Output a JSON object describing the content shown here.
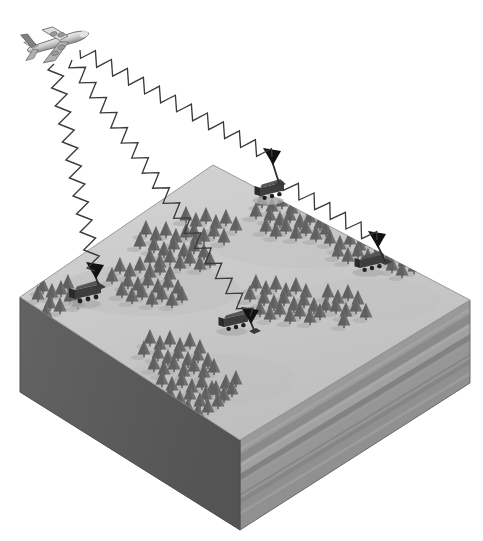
{
  "figure": {
    "domain": "Diagram",
    "kind": "isometric-block-diagram",
    "background_color": "#ffffff",
    "width": 483,
    "height": 541
  },
  "colors": {
    "background": "#ffffff",
    "terrain_top": "#c7c7c7",
    "terrain_top_highlight": "#d2d2d2",
    "terrain_shadow": "#b3b3b3",
    "block_left_face": "#5a5a5a",
    "block_right_face_base": "#8e8e8e",
    "strata_light": "#a6a6a6",
    "strata_mid": "#919191",
    "strata_dark": "#7d7d7d",
    "tree_body": "#6e6e6e",
    "tree_dark": "#555555",
    "vehicle_body": "#3d3d3d",
    "vehicle_dark": "#2a2a2a",
    "aircraft_light": "#dcdcdc",
    "aircraft_mid": "#b0b0b0",
    "aircraft_dark": "#808080",
    "signal_wave": "#3b3b3b",
    "receiver_arrow": "#111111",
    "outline": "#4a4a4a"
  },
  "aircraft": {
    "name": "transmitter-aircraft",
    "label": "airborne transmitter",
    "type": "four-engine jet airliner",
    "position": {
      "x": 58,
      "y": 42
    },
    "heading": "upper-right",
    "role": "signal source"
  },
  "terrain_block": {
    "name": "terrain-block",
    "label": "isometric terrain block",
    "top_face": {
      "name": "terrain-top-surface",
      "label": "forested ground surface",
      "corners": [
        {
          "x": 213,
          "y": 165
        },
        {
          "x": 470,
          "y": 300
        },
        {
          "x": 240,
          "y": 440
        },
        {
          "x": 20,
          "y": 297
        }
      ]
    },
    "left_face": {
      "name": "block-left-face",
      "label": "left cut face",
      "corners": [
        {
          "x": 20,
          "y": 297
        },
        {
          "x": 240,
          "y": 440
        },
        {
          "x": 240,
          "y": 530
        },
        {
          "x": 20,
          "y": 392
        }
      ],
      "fill": "#5a5a5a"
    },
    "right_face": {
      "name": "block-right-face",
      "label": "right cut face with geological strata",
      "corners": [
        {
          "x": 240,
          "y": 440
        },
        {
          "x": 470,
          "y": 300
        },
        {
          "x": 470,
          "y": 383
        },
        {
          "x": 240,
          "y": 530
        }
      ],
      "strata_count": 7
    }
  },
  "strata": [
    {
      "name": "stratum-1",
      "label": "upper layer",
      "offset": 0,
      "thickness": 14,
      "fill": "#9b9b9b"
    },
    {
      "name": "stratum-2",
      "label": "layer 2",
      "offset": 14,
      "thickness": 9,
      "fill": "#8a8a8a"
    },
    {
      "name": "stratum-3",
      "label": "layer 3",
      "offset": 23,
      "thickness": 11,
      "fill": "#a2a2a2"
    },
    {
      "name": "stratum-4",
      "label": "layer 4",
      "offset": 34,
      "thickness": 8,
      "fill": "#828282"
    },
    {
      "name": "stratum-5",
      "label": "layer 5",
      "offset": 42,
      "thickness": 12,
      "fill": "#979797"
    },
    {
      "name": "stratum-6",
      "label": "layer 6",
      "offset": 54,
      "thickness": 10,
      "fill": "#868686"
    },
    {
      "name": "stratum-7",
      "label": "lower layer",
      "offset": 64,
      "thickness": 26,
      "fill": "#909090"
    }
  ],
  "signals": [
    {
      "name": "signal-beam-1",
      "label": "signal to station 1 (far station, north-east)",
      "from": {
        "x": 80,
        "y": 50
      },
      "to": {
        "x": 272,
        "y": 157
      },
      "amplitude": 7,
      "wavelength": 9,
      "arrow": true
    },
    {
      "name": "signal-beam-2",
      "label": "signal to station 2 (west station)",
      "from": {
        "x": 54,
        "y": 64
      },
      "to": {
        "x": 95,
        "y": 271
      },
      "amplitude": 7,
      "wavelength": 9,
      "arrow": true
    },
    {
      "name": "signal-beam-3",
      "label": "signal to station 3 (centre station)",
      "from": {
        "x": 72,
        "y": 60
      },
      "to": {
        "x": 250,
        "y": 316
      },
      "amplitude": 7,
      "wavelength": 9,
      "arrow": true
    },
    {
      "name": "signal-beam-4",
      "label": "relay signal to station 4 (east station)",
      "from": {
        "x": 283,
        "y": 182
      },
      "to": {
        "x": 377,
        "y": 240
      },
      "amplitude": 7,
      "wavelength": 9,
      "arrow": true
    }
  ],
  "ground_stations": [
    {
      "name": "ground-station-west",
      "label": "mobile receiver station, west",
      "vehicle": {
        "x": 88,
        "y": 299,
        "scale": 1.0
      },
      "antenna": {
        "x": 99,
        "y": 283,
        "height": 18
      },
      "arrowhead": {
        "x": 95,
        "y": 271
      }
    },
    {
      "name": "ground-station-north",
      "label": "mobile receiver station, north",
      "vehicle": {
        "x": 272,
        "y": 196,
        "scale": 0.92
      },
      "antenna": {
        "x": 279,
        "y": 180,
        "height": 16
      },
      "arrowhead": {
        "x": 272,
        "y": 157
      }
    },
    {
      "name": "ground-station-centre",
      "label": "mobile receiver station, centre",
      "vehicle": {
        "x": 236,
        "y": 327,
        "scale": 0.92
      },
      "antenna": {
        "x": 254,
        "y": 327,
        "height": 16
      },
      "arrowhead": {
        "x": 250,
        "y": 316
      }
    },
    {
      "name": "ground-station-east",
      "label": "mobile receiver station, east",
      "vehicle": {
        "x": 372,
        "y": 268,
        "scale": 0.92
      },
      "antenna": {
        "x": 385,
        "y": 258,
        "height": 16
      },
      "arrowhead": {
        "x": 377,
        "y": 240
      }
    }
  ],
  "forest": {
    "name": "forest",
    "label": "coniferous tree cover",
    "tree_count": 168,
    "description": "scattered clusters of conical pine trees with cast shadows"
  },
  "tree_positions": [
    [
      43,
      293
    ],
    [
      52,
      299
    ],
    [
      61,
      296
    ],
    [
      70,
      303
    ],
    [
      50,
      310
    ],
    [
      60,
      313
    ],
    [
      38,
      301
    ],
    [
      68,
      290
    ],
    [
      78,
      308
    ],
    [
      46,
      319
    ],
    [
      120,
      273
    ],
    [
      130,
      278
    ],
    [
      140,
      272
    ],
    [
      150,
      279
    ],
    [
      160,
      274
    ],
    [
      170,
      281
    ],
    [
      128,
      288
    ],
    [
      138,
      292
    ],
    [
      148,
      287
    ],
    [
      158,
      294
    ],
    [
      168,
      289
    ],
    [
      178,
      295
    ],
    [
      112,
      283
    ],
    [
      122,
      297
    ],
    [
      132,
      303
    ],
    [
      142,
      299
    ],
    [
      152,
      306
    ],
    [
      162,
      301
    ],
    [
      172,
      307
    ],
    [
      182,
      302
    ],
    [
      146,
      236
    ],
    [
      156,
      242
    ],
    [
      166,
      237
    ],
    [
      176,
      244
    ],
    [
      186,
      239
    ],
    [
      196,
      246
    ],
    [
      154,
      252
    ],
    [
      164,
      257
    ],
    [
      174,
      251
    ],
    [
      184,
      258
    ],
    [
      194,
      253
    ],
    [
      204,
      259
    ],
    [
      140,
      248
    ],
    [
      150,
      264
    ],
    [
      160,
      269
    ],
    [
      170,
      264
    ],
    [
      180,
      270
    ],
    [
      190,
      265
    ],
    [
      200,
      271
    ],
    [
      210,
      267
    ],
    [
      186,
      222
    ],
    [
      196,
      228
    ],
    [
      206,
      223
    ],
    [
      216,
      230
    ],
    [
      226,
      225
    ],
    [
      236,
      232
    ],
    [
      194,
      238
    ],
    [
      204,
      243
    ],
    [
      214,
      238
    ],
    [
      224,
      244
    ],
    [
      262,
      207
    ],
    [
      272,
      213
    ],
    [
      282,
      208
    ],
    [
      292,
      215
    ],
    [
      302,
      210
    ],
    [
      312,
      216
    ],
    [
      270,
      222
    ],
    [
      280,
      227
    ],
    [
      290,
      222
    ],
    [
      300,
      229
    ],
    [
      310,
      224
    ],
    [
      320,
      230
    ],
    [
      256,
      218
    ],
    [
      266,
      233
    ],
    [
      276,
      238
    ],
    [
      286,
      233
    ],
    [
      296,
      240
    ],
    [
      306,
      235
    ],
    [
      316,
      241
    ],
    [
      326,
      236
    ],
    [
      330,
      245
    ],
    [
      340,
      251
    ],
    [
      350,
      246
    ],
    [
      360,
      252
    ],
    [
      370,
      247
    ],
    [
      380,
      253
    ],
    [
      338,
      258
    ],
    [
      348,
      263
    ],
    [
      358,
      258
    ],
    [
      368,
      264
    ],
    [
      378,
      259
    ],
    [
      388,
      265
    ],
    [
      396,
      254
    ],
    [
      406,
      260
    ],
    [
      414,
      252
    ],
    [
      424,
      258
    ],
    [
      404,
      268
    ],
    [
      414,
      273
    ],
    [
      392,
      272
    ],
    [
      402,
      277
    ],
    [
      256,
      290
    ],
    [
      266,
      296
    ],
    [
      276,
      291
    ],
    [
      286,
      298
    ],
    [
      296,
      293
    ],
    [
      306,
      299
    ],
    [
      264,
      305
    ],
    [
      274,
      310
    ],
    [
      284,
      305
    ],
    [
      294,
      312
    ],
    [
      304,
      307
    ],
    [
      314,
      313
    ],
    [
      250,
      301
    ],
    [
      260,
      316
    ],
    [
      270,
      321
    ],
    [
      280,
      316
    ],
    [
      290,
      323
    ],
    [
      300,
      318
    ],
    [
      310,
      324
    ],
    [
      320,
      319
    ],
    [
      328,
      299
    ],
    [
      338,
      305
    ],
    [
      348,
      300
    ],
    [
      358,
      306
    ],
    [
      336,
      313
    ],
    [
      346,
      318
    ],
    [
      356,
      313
    ],
    [
      366,
      319
    ],
    [
      326,
      312
    ],
    [
      344,
      327
    ],
    [
      150,
      345
    ],
    [
      160,
      351
    ],
    [
      170,
      346
    ],
    [
      180,
      353
    ],
    [
      190,
      348
    ],
    [
      200,
      355
    ],
    [
      158,
      360
    ],
    [
      168,
      365
    ],
    [
      178,
      360
    ],
    [
      188,
      367
    ],
    [
      198,
      362
    ],
    [
      208,
      368
    ],
    [
      144,
      356
    ],
    [
      154,
      371
    ],
    [
      164,
      376
    ],
    [
      174,
      371
    ],
    [
      184,
      378
    ],
    [
      194,
      373
    ],
    [
      204,
      379
    ],
    [
      214,
      374
    ],
    [
      162,
      386
    ],
    [
      172,
      392
    ],
    [
      182,
      387
    ],
    [
      192,
      394
    ],
    [
      202,
      389
    ],
    [
      212,
      396
    ],
    [
      170,
      401
    ],
    [
      180,
      406
    ],
    [
      190,
      401
    ],
    [
      200,
      408
    ],
    [
      188,
      414
    ],
    [
      198,
      419
    ],
    [
      208,
      414
    ],
    [
      218,
      408
    ],
    [
      206,
      401
    ],
    [
      216,
      396
    ],
    [
      226,
      390
    ],
    [
      224,
      402
    ],
    [
      232,
      396
    ],
    [
      236,
      386
    ]
  ]
}
